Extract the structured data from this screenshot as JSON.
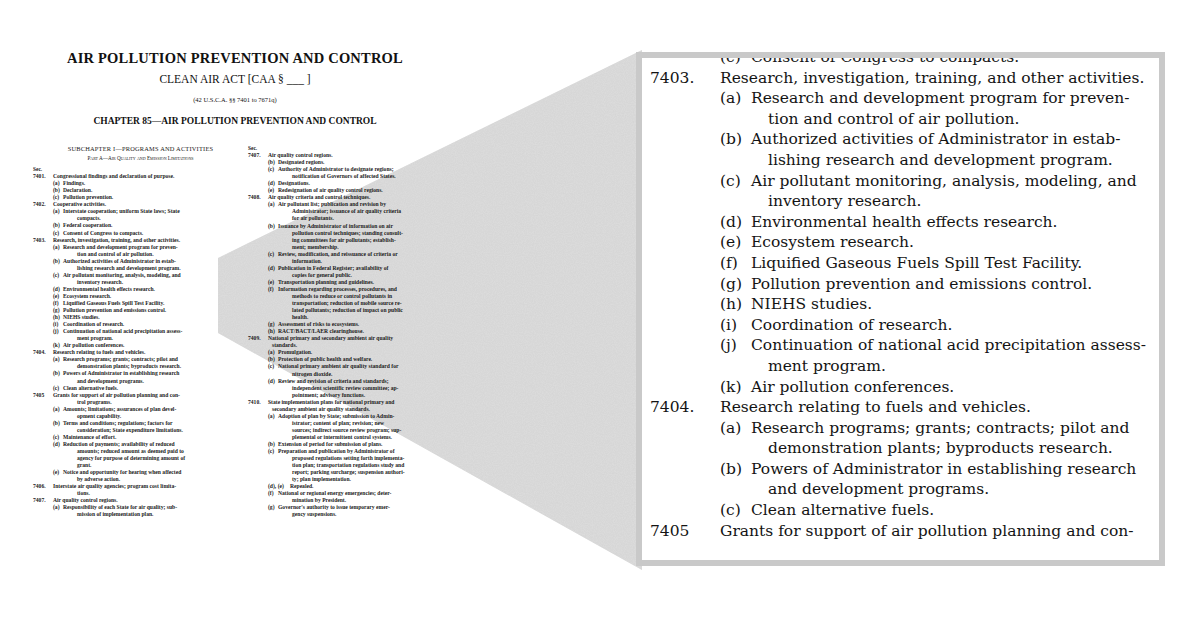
{
  "page": {
    "title": "AIR POLLUTION PREVENTION AND CONTROL",
    "subtitle": "CLEAN AIR ACT [CAA § ___ ]",
    "citation": "(42 U.S.C.A. §§ 7401 to 7671q)",
    "chapter": "CHAPTER 85—AIR POLLUTION PREVENTION AND CONTROL",
    "col1": {
      "subchapter": "SUBCHAPTER I—PROGRAMS AND ACTIVITIES",
      "part": "Part A—Air Quality and Emission Limitations",
      "sec_label": "Sec.",
      "lines": [
        {
          "type": "sec",
          "num": "7401.",
          "text": "Congressional findings and declaration of purpose."
        },
        {
          "type": "sub",
          "lbl": "(a)",
          "text": "Findings."
        },
        {
          "type": "sub",
          "lbl": "(b)",
          "text": "Declaration."
        },
        {
          "type": "sub",
          "lbl": "(c)",
          "text": "Pollution prevention."
        },
        {
          "type": "sec",
          "num": "7402.",
          "text": "Cooperative activities."
        },
        {
          "type": "sub",
          "lbl": "(a)",
          "text": "Interstate cooperation; uniform State laws; State"
        },
        {
          "type": "cont",
          "text": "compacts."
        },
        {
          "type": "sub",
          "lbl": "(b)",
          "text": "Federal cooperation."
        },
        {
          "type": "sub",
          "lbl": "(c)",
          "text": "Consent of Congress to compacts."
        },
        {
          "type": "sec",
          "num": "7403.",
          "text": "Research, investigation, training, and other activities."
        },
        {
          "type": "sub",
          "lbl": "(a)",
          "text": "Research and development program for preven-"
        },
        {
          "type": "cont",
          "text": "tion and control of air pollution."
        },
        {
          "type": "sub",
          "lbl": "(b)",
          "text": "Authorized activities of Administrator in estab-"
        },
        {
          "type": "cont",
          "text": "lishing research and development program."
        },
        {
          "type": "sub",
          "lbl": "(c)",
          "text": "Air pollutant monitoring, analysis, modeling, and"
        },
        {
          "type": "cont",
          "text": "inventory research."
        },
        {
          "type": "sub",
          "lbl": "(d)",
          "text": "Environmental health effects research."
        },
        {
          "type": "sub",
          "lbl": "(e)",
          "text": "Ecosystem research."
        },
        {
          "type": "sub",
          "lbl": "(f)",
          "text": "Liquified Gaseous Fuels Spill Test Facility."
        },
        {
          "type": "sub",
          "lbl": "(g)",
          "text": "Pollution prevention and emissions control."
        },
        {
          "type": "sub",
          "lbl": "(h)",
          "text": "NIEHS studies."
        },
        {
          "type": "sub",
          "lbl": "(i)",
          "text": "Coordination of research."
        },
        {
          "type": "sub",
          "lbl": "(j)",
          "text": "Continuation of national acid precipitation assess-"
        },
        {
          "type": "cont",
          "text": "ment program."
        },
        {
          "type": "sub",
          "lbl": "(k)",
          "text": "Air pollution conferences."
        },
        {
          "type": "sec",
          "num": "7404.",
          "text": "Research relating to fuels and vehicles."
        },
        {
          "type": "sub",
          "lbl": "(a)",
          "text": "Research programs; grants; contracts; pilot and"
        },
        {
          "type": "cont",
          "text": "demonstration plants; byproducts research."
        },
        {
          "type": "sub",
          "lbl": "(b)",
          "text": "Powers of Administrator in establishing research"
        },
        {
          "type": "cont",
          "text": "and development programs."
        },
        {
          "type": "sub",
          "lbl": "(c)",
          "text": "Clean alternative fuels."
        },
        {
          "type": "sec",
          "num": "7405",
          "text": "Grants for support of air pollution planning and con-"
        },
        {
          "type": "cont",
          "text": "trol programs."
        },
        {
          "type": "sub",
          "lbl": "(a)",
          "text": "Amounts; limitations; assurances of plan devel-"
        },
        {
          "type": "cont",
          "text": "opment capability."
        },
        {
          "type": "sub",
          "lbl": "(b)",
          "text": "Terms and conditions; regulations; factors for"
        },
        {
          "type": "cont",
          "text": "consideration; State expenditure limitations."
        },
        {
          "type": "sub",
          "lbl": "(c)",
          "text": "Maintenance of effort."
        },
        {
          "type": "sub",
          "lbl": "(d)",
          "text": "Reduction of payments; availability of reduced"
        },
        {
          "type": "cont",
          "text": "amounts; reduced amount as deemed paid to"
        },
        {
          "type": "cont",
          "text": "agency for purpose of determining amount of"
        },
        {
          "type": "cont",
          "text": "grant."
        },
        {
          "type": "sub",
          "lbl": "(e)",
          "text": "Notice and opportunity for hearing when affected"
        },
        {
          "type": "cont",
          "text": "by adverse action."
        },
        {
          "type": "sec",
          "num": "7406.",
          "text": "Interstate air quality agencies; program cost limita-"
        },
        {
          "type": "cont",
          "text": "tions."
        },
        {
          "type": "sec",
          "num": "7407.",
          "text": "Air quality control regions."
        },
        {
          "type": "sub",
          "lbl": "(a)",
          "text": "Responsibility of each State for air quality; sub-"
        },
        {
          "type": "cont",
          "text": "mission of implementation plan."
        }
      ]
    },
    "col2": {
      "sec_label": "Sec.",
      "lines": [
        {
          "type": "sec",
          "num": "7407.",
          "text": "Air quality control regions."
        },
        {
          "type": "sub",
          "lbl": "(b)",
          "text": "Designated regions."
        },
        {
          "type": "sub",
          "lbl": "(c)",
          "text": "Authority of Administrator to designate regions;"
        },
        {
          "type": "cont",
          "text": "notification of Governors of affected States."
        },
        {
          "type": "sub",
          "lbl": "(d)",
          "text": "Designations."
        },
        {
          "type": "sub",
          "lbl": "(e)",
          "text": "Redesignation of air quality control regions."
        },
        {
          "type": "sec",
          "num": "7408.",
          "text": "Air quality criteria and control techniques."
        },
        {
          "type": "sub",
          "lbl": "(a)",
          "text": "Air pollutant list; publication and revision by"
        },
        {
          "type": "cont",
          "text": "Administrator; issuance of air quality criteria"
        },
        {
          "type": "cont",
          "text": "for air pollutants."
        },
        {
          "type": "sub",
          "lbl": "(b)",
          "text": "Issuance by Administrator of information on air"
        },
        {
          "type": "cont",
          "text": "pollution control techniques; standing consult-"
        },
        {
          "type": "cont",
          "text": "ing committees for air pollutants; establish-"
        },
        {
          "type": "cont",
          "text": "ment; membership."
        },
        {
          "type": "sub",
          "lbl": "(c)",
          "text": "Review, modification, and reissuance of criteria or"
        },
        {
          "type": "cont",
          "text": "information."
        },
        {
          "type": "sub",
          "lbl": "(d)",
          "text": "Publication in Federal Register; availability of"
        },
        {
          "type": "cont",
          "text": "copies for general public."
        },
        {
          "type": "sub",
          "lbl": "(e)",
          "text": "Transportation planning and guidelines."
        },
        {
          "type": "sub",
          "lbl": "(f)",
          "text": "Information regarding processes, procedures, and"
        },
        {
          "type": "cont",
          "text": "methods to reduce or control pollutants in"
        },
        {
          "type": "cont",
          "text": "transportation; reduction of mobile source re-"
        },
        {
          "type": "cont",
          "text": "lated pollutants; reduction of impact on public"
        },
        {
          "type": "cont",
          "text": "health."
        },
        {
          "type": "sub",
          "lbl": "(g)",
          "text": "Assessment of risks to ecosystems."
        },
        {
          "type": "sub",
          "lbl": "(h)",
          "text": "RACT/BACT/LAER clearinghouse."
        },
        {
          "type": "sec",
          "num": "7409.",
          "text": "National primary and secondary ambient air quality"
        },
        {
          "type": "cont2",
          "text": "standards."
        },
        {
          "type": "sub",
          "lbl": "(a)",
          "text": "Promulgation."
        },
        {
          "type": "sub",
          "lbl": "(b)",
          "text": "Protection of public health and welfare."
        },
        {
          "type": "sub",
          "lbl": "(c)",
          "text": "National primary ambient air quality standard for"
        },
        {
          "type": "cont",
          "text": "nitrogen dioxide."
        },
        {
          "type": "sub",
          "lbl": "(d)",
          "text": "Review and revision of criteria and standards;"
        },
        {
          "type": "cont",
          "text": "independent scientific review committee; ap-"
        },
        {
          "type": "cont",
          "text": "pointment; advisory functions."
        },
        {
          "type": "sec",
          "num": "7410.",
          "text": "State implementation plans for national primary and"
        },
        {
          "type": "cont2",
          "text": "secondary ambient air quality standards."
        },
        {
          "type": "sub",
          "lbl": "(a)",
          "text": "Adoption of plan by State; submission to Admin-"
        },
        {
          "type": "cont",
          "text": "istrator; content of plan; revision; new"
        },
        {
          "type": "cont",
          "text": "sources; indirect source review program; sup-"
        },
        {
          "type": "cont",
          "text": "plemental or intermittent control systems."
        },
        {
          "type": "sub",
          "lbl": "(b)",
          "text": "Extension of period for submission of plans."
        },
        {
          "type": "sub",
          "lbl": "(c)",
          "text": "Preparation and publication by Administrator of"
        },
        {
          "type": "cont",
          "text": "proposed regulations setting forth implementa-"
        },
        {
          "type": "cont",
          "text": "tion plan; transportation regulations study and"
        },
        {
          "type": "cont",
          "text": "report; parking surcharge; suspension authori-"
        },
        {
          "type": "cont",
          "text": "ty; plan implementation."
        },
        {
          "type": "sub",
          "lbl": "(d), (e)",
          "text": "Repealed."
        },
        {
          "type": "sub",
          "lbl": "(f)",
          "text": "National or regional energy emergencies; deter-"
        },
        {
          "type": "cont",
          "text": "mination by President."
        },
        {
          "type": "sub",
          "lbl": "(g)",
          "text": "Governor's authority to issue temporary emer-"
        },
        {
          "type": "cont",
          "text": "gency suspensions."
        }
      ]
    }
  },
  "callout": {
    "border_color": "#c9c9c9",
    "wedge_color": "#d2d2d2",
    "lines": [
      {
        "type": "sub",
        "lbl": "(c)",
        "text": "Consent of Congress to compacts."
      },
      {
        "type": "sec",
        "num": "7403.",
        "text": "Research, investigation, training, and other activities."
      },
      {
        "type": "sub",
        "lbl": "(a)",
        "text": "Research and development program for preven-"
      },
      {
        "type": "cont",
        "text": "tion and control of air pollution."
      },
      {
        "type": "sub",
        "lbl": "(b)",
        "text": "Authorized activities of Administrator in estab-"
      },
      {
        "type": "cont",
        "text": "lishing research and development program."
      },
      {
        "type": "sub",
        "lbl": "(c)",
        "text": "Air pollutant monitoring, analysis, modeling, and"
      },
      {
        "type": "cont",
        "text": "inventory research."
      },
      {
        "type": "sub",
        "lbl": "(d)",
        "text": "Environmental health effects research."
      },
      {
        "type": "sub",
        "lbl": "(e)",
        "text": "Ecosystem research."
      },
      {
        "type": "sub",
        "lbl": "(f)",
        "text": "Liquified Gaseous Fuels Spill Test Facility."
      },
      {
        "type": "sub",
        "lbl": "(g)",
        "text": "Pollution prevention and emissions control."
      },
      {
        "type": "sub",
        "lbl": "(h)",
        "text": "NIEHS studies."
      },
      {
        "type": "sub",
        "lbl": "(i)",
        "text": "Coordination of research."
      },
      {
        "type": "sub",
        "lbl": "(j)",
        "text": "Continuation of national acid precipitation assess-"
      },
      {
        "type": "cont",
        "text": "ment program."
      },
      {
        "type": "sub",
        "lbl": "(k)",
        "text": "Air pollution conferences."
      },
      {
        "type": "sec",
        "num": "7404.",
        "text": "Research relating to fuels and vehicles."
      },
      {
        "type": "sub",
        "lbl": "(a)",
        "text": "Research programs; grants; contracts; pilot and"
      },
      {
        "type": "cont",
        "text": "demonstration plants; byproducts research."
      },
      {
        "type": "sub",
        "lbl": "(b)",
        "text": "Powers of Administrator in establishing research"
      },
      {
        "type": "cont",
        "text": "and development programs."
      },
      {
        "type": "sub",
        "lbl": "(c)",
        "text": "Clean alternative fuels."
      },
      {
        "type": "sec",
        "num": "7405",
        "text": "Grants for support of air pollution planning and con-"
      }
    ]
  }
}
